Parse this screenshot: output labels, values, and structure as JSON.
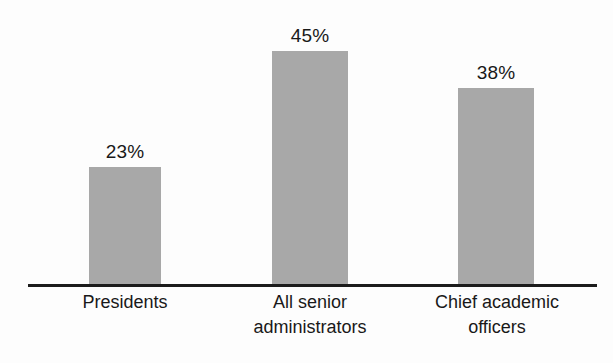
{
  "chart_data": {
    "type": "bar",
    "title": "",
    "subtitle": "",
    "xlabel": "",
    "ylabel": "",
    "categories": [
      "Presidents",
      "All senior administrators",
      "Chief academic officers"
    ],
    "category_lines": [
      [
        "Presidents"
      ],
      [
        "All senior",
        "administrators"
      ],
      [
        "Chief academic",
        "officers"
      ]
    ],
    "values": [
      23,
      45,
      38
    ],
    "value_labels": [
      "23%",
      "45%",
      "38%"
    ],
    "ylim": [
      0,
      55
    ],
    "grid": false,
    "legend": "none",
    "axis": "baseline-only",
    "colors": {
      "bar_fill": "#a8a8a8",
      "axis_line": "#1c1c1c",
      "text": "#191919",
      "background": "#fdfdfd"
    }
  },
  "layout": {
    "bars": [
      {
        "left": 89,
        "width": 72,
        "height": 118
      },
      {
        "left": 272,
        "width": 76,
        "height": 234
      },
      {
        "left": 458,
        "width": 76,
        "height": 197
      }
    ],
    "label_columns": [
      {
        "left": 55,
        "width": 140
      },
      {
        "left": 240,
        "width": 140
      },
      {
        "left": 424,
        "width": 146
      }
    ],
    "value_label_offset": 26
  }
}
